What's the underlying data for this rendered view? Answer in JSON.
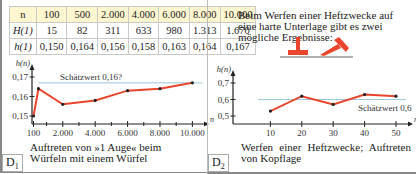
{
  "table": {
    "rows": [
      {
        "header": "n",
        "cells": [
          "100",
          "500",
          "2.000",
          "4.000",
          "6.000",
          "8.000",
          "10.000"
        ]
      },
      {
        "header": "H(1)",
        "cells": [
          "15",
          "82",
          "311",
          "633",
          "980",
          "1.313",
          "1.670"
        ]
      },
      {
        "header": "h(1)",
        "cells": [
          "0,150",
          "0,164",
          "0,156",
          "0,158",
          "0,163",
          "0,164",
          "0,167"
        ]
      }
    ]
  },
  "panel2": {
    "intro": "Beim Werfen einer Heftzwecke auf eine harte Unterlage gibt es zwei mögliche Ergebnisse:",
    "pin_color": "#e8452c"
  },
  "chart_data": [
    {
      "type": "line",
      "id": "D1",
      "ylabel": "h(n)",
      "xlabel": "n",
      "x": [
        100,
        500,
        2000,
        4000,
        6000,
        8000,
        10000
      ],
      "values": [
        0.15,
        0.164,
        0.156,
        0.158,
        0.163,
        0.164,
        0.167
      ],
      "xlim": [
        100,
        10000
      ],
      "ylim": [
        0.15,
        0.17
      ],
      "xticks": [
        100,
        2000,
        4000,
        6000,
        8000,
        10000
      ],
      "xtick_labels": [
        "100",
        "2.000",
        "4.000",
        "6.000",
        "8.000",
        "10.000"
      ],
      "yticks": [
        0.15,
        0.16,
        0.17
      ],
      "ytick_labels": [
        "0,15",
        "0,16",
        "0,17"
      ],
      "reference_line": {
        "value": 0.167,
        "label": "Schätzwert 0,16?"
      },
      "caption": "Auftreten von »1 Auge« beim Würfeln mit einem Würfel",
      "tag": "D",
      "tag_sub": "1",
      "line_color": "#e8452c",
      "ref_color": "#9cc7dd"
    },
    {
      "type": "line",
      "id": "D2",
      "ylabel": "h(n)",
      "xlabel": "n",
      "x": [
        10,
        20,
        30,
        40,
        50
      ],
      "values": [
        0.53,
        0.62,
        0.57,
        0.63,
        0.62
      ],
      "xlim": [
        0,
        50
      ],
      "ylim": [
        0.5,
        0.7
      ],
      "xticks": [
        10,
        20,
        30,
        40,
        50
      ],
      "xtick_labels": [
        "10",
        "20",
        "30",
        "40",
        "50"
      ],
      "yticks": [
        0.5,
        0.6,
        0.7
      ],
      "ytick_labels": [
        "0,5",
        "0,6",
        "0,7"
      ],
      "reference_line": {
        "value": 0.6,
        "label": "Schätzwert 0,6"
      },
      "caption": "Werfen einer Heftzwecke; Auftreten von Kopflage",
      "tag": "D",
      "tag_sub": "2",
      "line_color": "#e8452c",
      "ref_color": "#9cc7dd"
    }
  ]
}
